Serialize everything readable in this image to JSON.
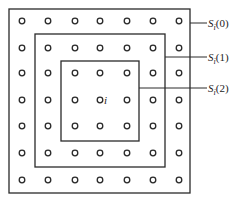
{
  "diagram": {
    "grid": {
      "cols": 7,
      "rows": 7,
      "xs": [
        22,
        48,
        75,
        100,
        127,
        153,
        179
      ],
      "ys": [
        21,
        48,
        73,
        100,
        126,
        153,
        180
      ],
      "node_radius": 2.8,
      "center_label": "i"
    },
    "boxes": [
      {
        "name": "S(0)",
        "x": 9,
        "y": 9,
        "w": 181,
        "h": 184
      },
      {
        "name": "S(1)",
        "x": 35,
        "y": 34,
        "w": 130,
        "h": 133
      },
      {
        "name": "S(2)",
        "x": 61,
        "y": 61,
        "w": 78,
        "h": 80
      }
    ],
    "labels": [
      {
        "base": "S",
        "sub": "i",
        "arg": "(0)",
        "line_y": 23,
        "line_x1": 190
      },
      {
        "base": "S",
        "sub": "i",
        "arg": "(1)",
        "line_y": 57,
        "line_x1": 165
      },
      {
        "base": "S",
        "sub": "i",
        "arg": "(2)",
        "line_y": 88,
        "line_x1": 139
      }
    ],
    "colors": {
      "stroke": "#2a2a2a",
      "background": "#ffffff"
    }
  }
}
